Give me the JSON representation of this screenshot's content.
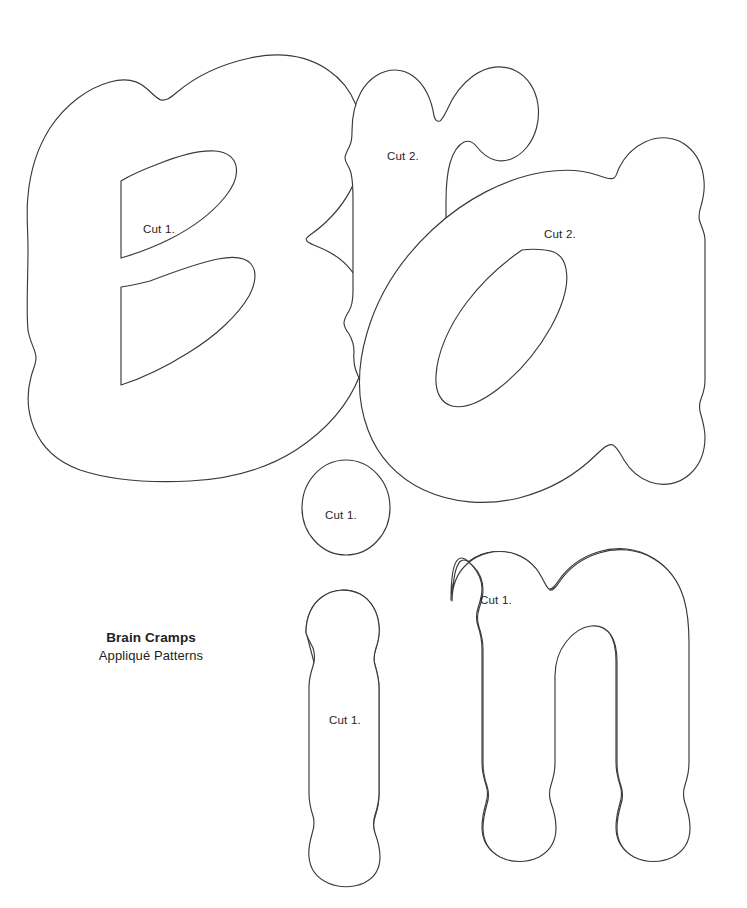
{
  "sheet": {
    "width": 747,
    "height": 908,
    "background_color": "#ffffff",
    "outline_color": "#3a3a3a",
    "text_color": "#231f20"
  },
  "title_block": {
    "name": "Brain Cramps",
    "subtitle": "Appliqué Patterns"
  },
  "pieces": [
    {
      "id": "letter-b",
      "letter": "B",
      "cut_label": "Cut 1.",
      "label_x": 143,
      "label_y": 230,
      "has_counters": true,
      "counter_count": 2
    },
    {
      "id": "letter-r",
      "letter": "r",
      "cut_label": "Cut 2.",
      "label_x": 387,
      "label_y": 157,
      "has_counters": false,
      "counter_count": 0
    },
    {
      "id": "letter-a",
      "letter": "a",
      "cut_label": "Cut 2.",
      "label_x": 548,
      "label_y": 235,
      "has_counters": true,
      "counter_count": 1
    },
    {
      "id": "letter-i-dot",
      "letter": "i-dot",
      "cut_label": "Cut 1.",
      "label_x": 327,
      "label_y": 516,
      "has_counters": false,
      "counter_count": 0
    },
    {
      "id": "letter-i-stem",
      "letter": "i-stem",
      "cut_label": "Cut 1.",
      "label_x": 329,
      "label_y": 721,
      "has_counters": false,
      "counter_count": 0
    },
    {
      "id": "letter-n",
      "letter": "n",
      "cut_label": "Cut 1.",
      "label_x": 480,
      "label_y": 601,
      "has_counters": false,
      "counter_count": 0
    }
  ],
  "word": "Brain"
}
